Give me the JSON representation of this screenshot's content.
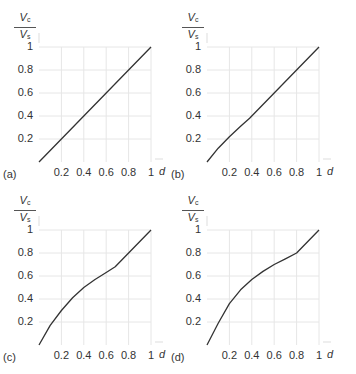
{
  "chart_data": [
    {
      "type": "line",
      "panel_label": "(a)",
      "xlabel": "d",
      "ylabel": "Vc/Vs",
      "xticks": [
        "0.2",
        "0.4",
        "0.6",
        "0.8",
        "1"
      ],
      "yticks": [
        "0.2",
        "0.4",
        "0.6",
        "0.8",
        "1"
      ],
      "xlim": [
        0,
        1
      ],
      "ylim": [
        0,
        1
      ],
      "grid": true,
      "x": [
        0,
        0.2,
        0.4,
        0.6,
        0.8,
        1.0
      ],
      "y": [
        0,
        0.2,
        0.4,
        0.6,
        0.8,
        1.0
      ]
    },
    {
      "type": "line",
      "panel_label": "(b)",
      "xlabel": "d",
      "ylabel": "Vc/Vs",
      "xticks": [
        "0.2",
        "0.4",
        "0.6",
        "0.8",
        "1"
      ],
      "yticks": [
        "0.2",
        "0.4",
        "0.6",
        "0.8",
        "1"
      ],
      "xlim": [
        0,
        1
      ],
      "ylim": [
        0,
        1
      ],
      "grid": true,
      "x": [
        0,
        0.1,
        0.2,
        0.3,
        0.38,
        0.5,
        0.6,
        0.8,
        1.0
      ],
      "y": [
        0,
        0.12,
        0.22,
        0.31,
        0.38,
        0.5,
        0.6,
        0.8,
        1.0
      ]
    },
    {
      "type": "line",
      "panel_label": "(c)",
      "xlabel": "d",
      "ylabel": "Vc/Vs",
      "xticks": [
        "0.2",
        "0.4",
        "0.6",
        "0.8",
        "1"
      ],
      "yticks": [
        "0.2",
        "0.4",
        "0.6",
        "0.8",
        "1"
      ],
      "xlim": [
        0,
        1
      ],
      "ylim": [
        0,
        1
      ],
      "grid": true,
      "x": [
        0,
        0.1,
        0.2,
        0.3,
        0.4,
        0.5,
        0.6,
        0.68,
        0.8,
        0.9,
        1.0
      ],
      "y": [
        0,
        0.17,
        0.3,
        0.41,
        0.5,
        0.57,
        0.63,
        0.68,
        0.8,
        0.9,
        1.0
      ]
    },
    {
      "type": "line",
      "panel_label": "(d)",
      "xlabel": "d",
      "ylabel": "Vc/Vs",
      "xticks": [
        "0.2",
        "0.4",
        "0.6",
        "0.8",
        "1"
      ],
      "yticks": [
        "0.2",
        "0.4",
        "0.6",
        "0.8",
        "1"
      ],
      "xlim": [
        0,
        1
      ],
      "ylim": [
        0,
        1
      ],
      "grid": true,
      "x": [
        0,
        0.1,
        0.2,
        0.3,
        0.4,
        0.5,
        0.6,
        0.7,
        0.8,
        0.9,
        1.0
      ],
      "y": [
        0,
        0.19,
        0.36,
        0.48,
        0.57,
        0.64,
        0.7,
        0.75,
        0.8,
        0.9,
        1.0
      ]
    }
  ],
  "labels": {
    "y_num": "V",
    "y_num_sub": "c",
    "y_den": "V",
    "y_den_sub": "s",
    "x_axis": "d",
    "panels": [
      "(a)",
      "(b)",
      "(c)",
      "(d)"
    ]
  },
  "colors": {
    "curve": "#333333",
    "grid": "#e6e6e6",
    "text": "#333333"
  }
}
